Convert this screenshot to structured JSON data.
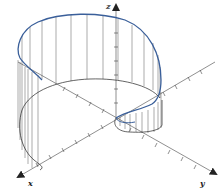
{
  "figure": {
    "colors": {
      "curve": "#3a5f9a",
      "base": "#222222",
      "verticals": "#555555",
      "axes": "#444444",
      "background": "#ffffff"
    },
    "axes": {
      "x_label": "x",
      "y_label": "y",
      "z_label": "z"
    }
  }
}
